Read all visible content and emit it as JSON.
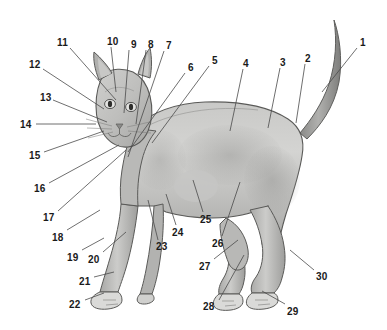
{
  "figure": {
    "style": "grayscale-anatomical-illustration",
    "background_color": "#ffffff",
    "label_color": "#1a1a1a",
    "leader_line_color": "#4a4a4a",
    "fur_light": "#d8d8d6",
    "fur_mid": "#b5b5b3",
    "fur_dark": "#8f8f8d",
    "outline_color": "#5a5a58",
    "width": 387,
    "height": 330
  },
  "callouts": [
    {
      "id": "1",
      "text": "1",
      "x": 360,
      "y": 38,
      "line": [
        357,
        48,
        322,
        92
      ]
    },
    {
      "id": "2",
      "text": "2",
      "x": 305,
      "y": 54,
      "line": [
        305,
        64,
        296,
        123
      ]
    },
    {
      "id": "3",
      "text": "3",
      "x": 280,
      "y": 58,
      "line": [
        280,
        68,
        268,
        128
      ]
    },
    {
      "id": "4",
      "text": "4",
      "x": 243,
      "y": 59,
      "line": [
        243,
        69,
        230,
        131
      ]
    },
    {
      "id": "5",
      "text": "5",
      "x": 212,
      "y": 56,
      "line": [
        209,
        66,
        152,
        143
      ]
    },
    {
      "id": "6",
      "text": "6",
      "x": 188,
      "y": 63,
      "line": [
        185,
        73,
        128,
        152
      ]
    },
    {
      "id": "7",
      "text": "7",
      "x": 166,
      "y": 41,
      "line": [
        164,
        51,
        128,
        157
      ]
    },
    {
      "id": "8",
      "text": "8",
      "x": 148,
      "y": 40,
      "line": [
        146,
        50,
        136,
        124
      ]
    },
    {
      "id": "9",
      "text": "9",
      "x": 131,
      "y": 40,
      "line": [
        129,
        50,
        124,
        113
      ]
    },
    {
      "id": "10",
      "text": "10",
      "x": 107,
      "y": 37,
      "line": [
        111,
        47,
        116,
        92
      ]
    },
    {
      "id": "11",
      "text": "11",
      "x": 57,
      "y": 38,
      "line": [
        70,
        48,
        116,
        100
      ]
    },
    {
      "id": "12",
      "text": "12",
      "x": 29,
      "y": 60,
      "line": [
        43,
        69,
        104,
        109
      ]
    },
    {
      "id": "13",
      "text": "13",
      "x": 40,
      "y": 93,
      "line": [
        53,
        100,
        107,
        122
      ]
    },
    {
      "id": "14",
      "text": "14",
      "x": 20,
      "y": 120,
      "line": [
        36,
        124,
        96,
        124
      ]
    },
    {
      "id": "15",
      "text": "15",
      "x": 29,
      "y": 151,
      "line": [
        44,
        152,
        104,
        131
      ]
    },
    {
      "id": "16",
      "text": "16",
      "x": 34,
      "y": 184,
      "line": [
        49,
        183,
        119,
        145
      ]
    },
    {
      "id": "17",
      "text": "17",
      "x": 43,
      "y": 213,
      "line": [
        58,
        211,
        126,
        150
      ]
    },
    {
      "id": "18",
      "text": "18",
      "x": 52,
      "y": 233,
      "line": [
        67,
        230,
        100,
        210
      ]
    },
    {
      "id": "19",
      "text": "19",
      "x": 67,
      "y": 253,
      "line": [
        82,
        250,
        104,
        238
      ]
    },
    {
      "id": "20",
      "text": "20",
      "x": 88,
      "y": 255,
      "line": [
        103,
        252,
        126,
        232
      ]
    },
    {
      "id": "21",
      "text": "21",
      "x": 79,
      "y": 277,
      "line": [
        94,
        277,
        114,
        272
      ]
    },
    {
      "id": "22",
      "text": "22",
      "x": 69,
      "y": 300,
      "line": [
        85,
        300,
        104,
        293
      ]
    },
    {
      "id": "23",
      "text": "23",
      "x": 156,
      "y": 242,
      "line": [
        158,
        240,
        148,
        200
      ]
    },
    {
      "id": "24",
      "text": "24",
      "x": 172,
      "y": 228,
      "line": [
        176,
        225,
        166,
        194
      ]
    },
    {
      "id": "25",
      "text": "25",
      "x": 200,
      "y": 215,
      "line": [
        203,
        212,
        193,
        180
      ]
    },
    {
      "id": "26",
      "text": "26",
      "x": 212,
      "y": 239,
      "line": [
        222,
        236,
        240,
        182
      ]
    },
    {
      "id": "27",
      "text": "27",
      "x": 199,
      "y": 262,
      "line": [
        214,
        259,
        238,
        240
      ]
    },
    {
      "id": "28",
      "text": "28",
      "x": 203,
      "y": 302,
      "line": [
        219,
        300,
        244,
        255
      ]
    },
    {
      "id": "29",
      "text": "29",
      "x": 287,
      "y": 307,
      "line": [
        285,
        304,
        262,
        291
      ]
    },
    {
      "id": "30",
      "text": "30",
      "x": 316,
      "y": 272,
      "line": [
        314,
        270,
        290,
        250
      ]
    }
  ]
}
